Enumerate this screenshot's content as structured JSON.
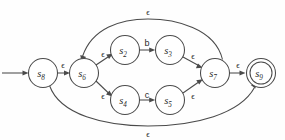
{
  "diagram": {
    "type": "finite-automaton",
    "canvas": {
      "width": 285,
      "height": 140
    },
    "style": {
      "stroke_color": "#4a4a4a",
      "text_color": "#2b2b2b",
      "node_fill": "#ffffff",
      "background": "#fefefe",
      "node_radius": 14.5,
      "accept_inner_radius": 11.0
    },
    "epsilon_symbol": "ϵ",
    "start_marker": {
      "name": "start-arrow",
      "from_x": 2,
      "to_x": 26,
      "y": 73
    },
    "nodes": [
      {
        "id": "s8",
        "label_base": "s",
        "label_sub": "8",
        "cx": 43,
        "cy": 73,
        "accepting": false
      },
      {
        "id": "s6",
        "label_base": "s",
        "label_sub": "6",
        "cx": 84,
        "cy": 73,
        "accepting": false
      },
      {
        "id": "s2",
        "label_base": "s",
        "label_sub": "2",
        "cx": 125,
        "cy": 50,
        "accepting": false
      },
      {
        "id": "s3",
        "label_base": "s",
        "label_sub": "3",
        "cx": 170,
        "cy": 50,
        "accepting": false
      },
      {
        "id": "s4",
        "label_base": "s",
        "label_sub": "4",
        "cx": 125,
        "cy": 100,
        "accepting": false
      },
      {
        "id": "s5",
        "label_base": "s",
        "label_sub": "5",
        "cx": 170,
        "cy": 100,
        "accepting": false
      },
      {
        "id": "s7",
        "label_base": "s",
        "label_sub": "7",
        "cx": 215,
        "cy": 73,
        "accepting": false
      },
      {
        "id": "s9",
        "label_base": "s",
        "label_sub": "9",
        "cx": 261,
        "cy": 73,
        "accepting": true
      }
    ],
    "edges": [
      {
        "id": "e-s8-s6",
        "from": "s8",
        "to": "s6",
        "label": "ϵ",
        "label_x": 63,
        "label_y": 65,
        "kind": "straight"
      },
      {
        "id": "e-s6-s2",
        "from": "s6",
        "to": "s2",
        "label": "ϵ",
        "label_x": 103,
        "label_y": 54,
        "kind": "straight"
      },
      {
        "id": "e-s2-s3",
        "from": "s2",
        "to": "s3",
        "label": "b",
        "label_x": 147,
        "label_y": 43,
        "kind": "straight"
      },
      {
        "id": "e-s3-s7",
        "from": "s3",
        "to": "s7",
        "label": "ϵ",
        "label_x": 193,
        "label_y": 56,
        "kind": "straight"
      },
      {
        "id": "e-s6-s4",
        "from": "s6",
        "to": "s4",
        "label": "ϵ",
        "label_x": 103,
        "label_y": 96,
        "kind": "straight"
      },
      {
        "id": "e-s4-s5",
        "from": "s4",
        "to": "s5",
        "label": "c",
        "label_x": 147,
        "label_y": 95,
        "kind": "straight"
      },
      {
        "id": "e-s5-s7",
        "from": "s5",
        "to": "s7",
        "label": "ϵ",
        "label_x": 193,
        "label_y": 96,
        "kind": "straight"
      },
      {
        "id": "e-s7-s9",
        "from": "s7",
        "to": "s9",
        "label": "ϵ",
        "label_x": 238,
        "label_y": 65,
        "kind": "straight"
      },
      {
        "id": "e-s7-s6",
        "from": "s7",
        "to": "s6",
        "label": "ϵ",
        "label_x": 148,
        "label_y": 13,
        "kind": "arc-top"
      },
      {
        "id": "e-s8-s9",
        "from": "s8",
        "to": "s9",
        "label": "ϵ",
        "label_x": 148,
        "label_y": 133,
        "kind": "arc-bottom"
      }
    ]
  }
}
